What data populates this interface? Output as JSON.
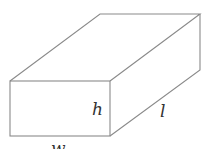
{
  "diagram": {
    "type": "rectangular-prism",
    "labels": {
      "height": "h",
      "length": "l",
      "width": "w"
    },
    "colors": {
      "edge": "#8a8a8a",
      "label": "#333333",
      "background": "#ffffff"
    }
  }
}
